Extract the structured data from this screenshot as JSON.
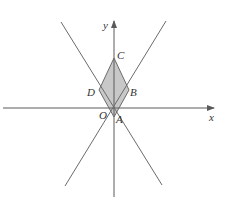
{
  "figure": {
    "axes": {
      "x_label": "x",
      "y_label": "y",
      "origin_label": "O"
    },
    "points": {
      "A": "A",
      "B": "B",
      "C": "C",
      "D": "D"
    },
    "shaded_region": "quadrilateral ABCD",
    "colors": {
      "line": "#6b6b6b",
      "axis": "#5a5a5a",
      "fill": "#c8c8c8",
      "text": "#333333"
    }
  }
}
